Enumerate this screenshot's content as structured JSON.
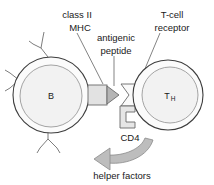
{
  "figure": {
    "background_color": "#ffffff",
    "line_color": "#3d3d3d",
    "fill_light": "#f2f2f2",
    "fill_mid": "#e2e2e2",
    "fill_dark": "#b5b5b5"
  },
  "labels": {
    "class_ii": "class II",
    "mhc": "MHC",
    "antigenic": "antigenic",
    "peptide": "peptide",
    "tcell": "T-cell",
    "receptor": "receptor",
    "cd4": "CD4",
    "helper_factors": "helper factors"
  },
  "cells": {
    "b_cell": {
      "label": "B",
      "name": "B lymphocyte"
    },
    "t_cell": {
      "label": "T",
      "subscript": "H",
      "name": "T helper lymphocyte"
    }
  },
  "structures": [
    {
      "name": "class-II-MHC",
      "label": "class II MHC"
    },
    {
      "name": "antigenic-peptide",
      "label": "antigenic peptide"
    },
    {
      "name": "t-cell-receptor",
      "label": "T-cell receptor"
    },
    {
      "name": "cd4-coreceptor",
      "label": "CD4"
    },
    {
      "name": "helper-factors-arrow",
      "label": "helper factors"
    },
    {
      "name": "surface-antibody",
      "label": "membrane immunoglobulin"
    }
  ]
}
